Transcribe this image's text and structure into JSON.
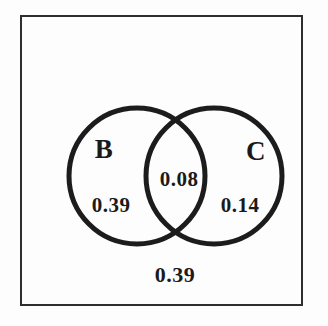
{
  "diagram": {
    "type": "venn",
    "sets": [
      {
        "label": "B",
        "only_value": "0.39"
      },
      {
        "label": "C",
        "only_value": "0.14"
      }
    ],
    "intersection_value": "0.08",
    "outside_value": "0.39",
    "colors": {
      "circle_stroke": "#1c1c1c",
      "frame_border": "#2e2e2e",
      "text": "#1a1a1a",
      "background": "#fdfdfd"
    }
  }
}
